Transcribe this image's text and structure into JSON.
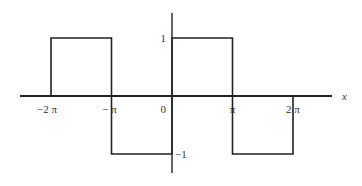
{
  "chart_data": {
    "type": "line",
    "title": "",
    "xlabel": "x",
    "ylabel": "",
    "xlim": [
      -7.0,
      9.5
    ],
    "ylim": [
      -1.5,
      1.65
    ],
    "grid": false,
    "legend": null,
    "x_ticks": [
      {
        "value": -6.283185,
        "label": "−2 π"
      },
      {
        "value": -3.141593,
        "label": "− π"
      },
      {
        "value": 0,
        "label": "0"
      },
      {
        "value": 3.141593,
        "label": "π"
      },
      {
        "value": 6.283185,
        "label": "2 π"
      }
    ],
    "y_ticks": [
      {
        "value": 1,
        "label": "1"
      },
      {
        "value": -1,
        "label": "−1"
      }
    ],
    "series": [
      {
        "name": "square wave",
        "color": "#222222",
        "points": [
          [
            -6.283185,
            0
          ],
          [
            -6.283185,
            1
          ],
          [
            -3.141593,
            1
          ],
          [
            -3.141593,
            0
          ],
          [
            -3.141593,
            -1
          ],
          [
            0,
            -1
          ],
          [
            0,
            0
          ],
          [
            0,
            1
          ],
          [
            3.141593,
            1
          ],
          [
            3.141593,
            0
          ],
          [
            3.141593,
            -1
          ],
          [
            6.283185,
            -1
          ],
          [
            6.283185,
            0
          ]
        ]
      }
    ]
  }
}
